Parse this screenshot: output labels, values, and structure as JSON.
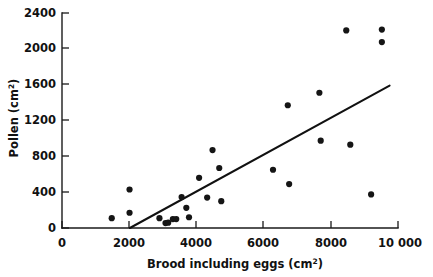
{
  "figure": {
    "background_color": "#ffffff",
    "point_color": "#151515",
    "line_color": "#111111",
    "axis_color": "#1a1a1a"
  },
  "axes": {
    "x_title_main": "Brood including eggs  (cm",
    "x_title_sup": "2",
    "x_title_tail": ")",
    "x_title_full": "Brood including eggs (cm2)",
    "y_title_main": "Pollen  (cm",
    "y_title_sup": "2",
    "y_title_tail": ")",
    "y_title_full": "Pollen (cm2)",
    "x_ticks": [
      "0",
      "2000",
      "4000",
      "6000",
      "8000",
      "10 000"
    ],
    "y_ticks": [
      "0",
      "400",
      "800",
      "1200",
      "1600",
      "2000",
      "2400"
    ]
  },
  "chart_data": {
    "type": "scatter",
    "title": "",
    "subtitle": "",
    "xlabel": "Brood including eggs (cm2)",
    "ylabel": "Pollen (cm2)",
    "xlim": [
      0,
      10000
    ],
    "ylim": [
      0,
      2400
    ],
    "xticks": [
      0,
      2000,
      4000,
      6000,
      8000,
      10000
    ],
    "xticklabels": [
      "0",
      "2000",
      "4000",
      "6000",
      "8000",
      "10 000"
    ],
    "yticks": [
      0,
      400,
      800,
      1200,
      1600,
      2000,
      2400
    ],
    "yticklabels": [
      "0",
      "400",
      "800",
      "1200",
      "1600",
      "2000",
      "2400"
    ],
    "grid": false,
    "legend": null,
    "series": [
      {
        "name": "colonies",
        "marker": "filled-circle",
        "points": [
          {
            "x": 1480,
            "y": 110
          },
          {
            "x": 2010,
            "y": 430
          },
          {
            "x": 2010,
            "y": 170
          },
          {
            "x": 2900,
            "y": 110
          },
          {
            "x": 3080,
            "y": 55
          },
          {
            "x": 3160,
            "y": 60
          },
          {
            "x": 3300,
            "y": 100
          },
          {
            "x": 3400,
            "y": 100
          },
          {
            "x": 3560,
            "y": 345
          },
          {
            "x": 3700,
            "y": 225
          },
          {
            "x": 3780,
            "y": 120
          },
          {
            "x": 4080,
            "y": 560
          },
          {
            "x": 4320,
            "y": 340
          },
          {
            "x": 4480,
            "y": 870
          },
          {
            "x": 4680,
            "y": 670
          },
          {
            "x": 4740,
            "y": 300
          },
          {
            "x": 6280,
            "y": 650
          },
          {
            "x": 6720,
            "y": 1370
          },
          {
            "x": 6760,
            "y": 490
          },
          {
            "x": 7660,
            "y": 1510
          },
          {
            "x": 7700,
            "y": 975
          },
          {
            "x": 8460,
            "y": 2205
          },
          {
            "x": 8580,
            "y": 930
          },
          {
            "x": 9200,
            "y": 375
          },
          {
            "x": 9520,
            "y": 2215
          },
          {
            "x": 9520,
            "y": 2075
          }
        ]
      }
    ],
    "fit_line": {
      "name": "regression-line",
      "x_start": 2020,
      "y_start": 0,
      "x_end": 9750,
      "y_end": 1590
    }
  }
}
